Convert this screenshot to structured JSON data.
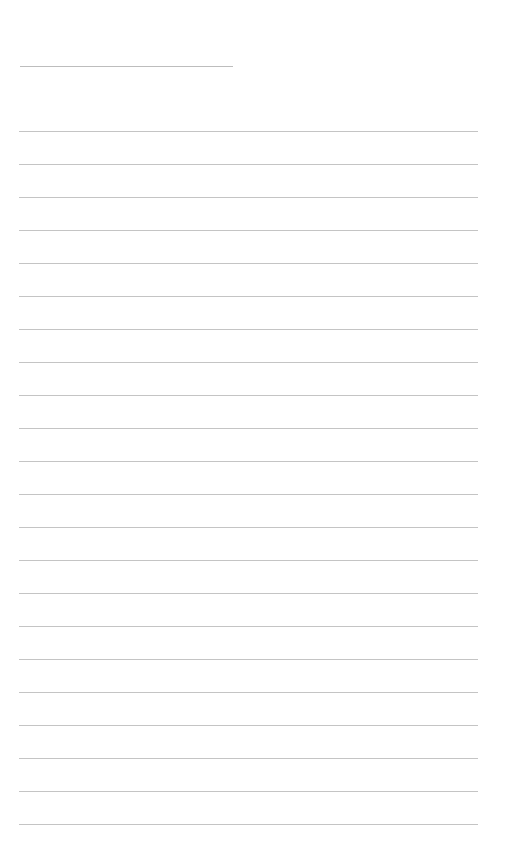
{
  "page": {
    "type": "blank lined sheet",
    "background_color": "#ffffff",
    "line_color": "#c4c4c4"
  },
  "title_line": {
    "label": "",
    "value": ""
  },
  "ruled_lines": [
    {
      "text": ""
    },
    {
      "text": ""
    },
    {
      "text": ""
    },
    {
      "text": ""
    },
    {
      "text": ""
    },
    {
      "text": ""
    },
    {
      "text": ""
    },
    {
      "text": ""
    },
    {
      "text": ""
    },
    {
      "text": ""
    },
    {
      "text": ""
    },
    {
      "text": ""
    },
    {
      "text": ""
    },
    {
      "text": ""
    },
    {
      "text": ""
    },
    {
      "text": ""
    },
    {
      "text": ""
    },
    {
      "text": ""
    },
    {
      "text": ""
    },
    {
      "text": ""
    },
    {
      "text": ""
    },
    {
      "text": ""
    }
  ]
}
